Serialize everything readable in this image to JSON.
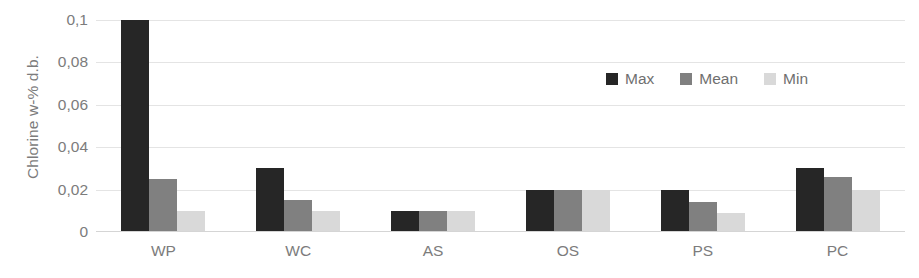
{
  "chart_data": {
    "type": "bar",
    "title": "",
    "xlabel": "",
    "ylabel": "Chlorine w-% d.b.",
    "categories": [
      "WP",
      "WC",
      "AS",
      "OS",
      "PS",
      "PC"
    ],
    "series": [
      {
        "name": "Max",
        "color": "#262626",
        "values": [
          0.1,
          0.03,
          0.01,
          0.02,
          0.02,
          0.03
        ]
      },
      {
        "name": "Mean",
        "color": "#808080",
        "values": [
          0.025,
          0.015,
          0.01,
          0.02,
          0.014,
          0.026
        ]
      },
      {
        "name": "Min",
        "color": "#d9d9d9",
        "values": [
          0.01,
          0.01,
          0.01,
          0.02,
          0.009,
          0.02
        ]
      }
    ],
    "ylim": [
      0,
      0.1
    ],
    "ytick_values": [
      0,
      0.02,
      0.04,
      0.06,
      0.08,
      0.1
    ],
    "ytick_labels": [
      "0",
      "0,02",
      "0,04",
      "0,06",
      "0,08",
      "0,1"
    ],
    "grid": true,
    "legend_position": "top-right"
  }
}
